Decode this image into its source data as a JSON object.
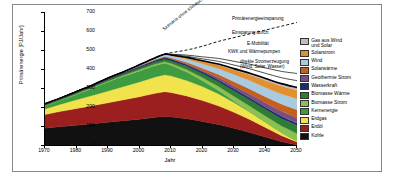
{
  "axes": {
    "ylabel": "Primärenergie [PJ/Jahr]",
    "xlabel": "Jahr",
    "yticks": [
      0,
      100,
      200,
      300,
      400,
      500,
      600,
      700
    ],
    "xticks": [
      1970,
      1980,
      1990,
      2000,
      2010,
      2020,
      2030,
      2040,
      2050
    ]
  },
  "annotations": {
    "saving": "Primärenergieeinsparung",
    "through": "Einsparung durch:",
    "emobility": "E-Mobilität",
    "chp": "KWK und Wärmepumpen",
    "direct": "direkte Stromerzeugung\n(Wind, Solar, Wasser)",
    "bau": "Szenario ohne Klimaschutz"
  },
  "legend": [
    {
      "label": "Gas aus Wind\nund Solar",
      "color": "#c9b6c4"
    },
    {
      "label": "Solarstrom",
      "color": "#e09030"
    },
    {
      "label": "Wind",
      "color": "#a8cbe2"
    },
    {
      "label": "Solarwärme",
      "color": "#c4601e"
    },
    {
      "label": "Geothermie Strom",
      "color": "#7b4f86"
    },
    {
      "label": "Wasserkraft",
      "color": "#1b2d6b"
    },
    {
      "label": "Biomasse Wärme",
      "color": "#2f7d32"
    },
    {
      "label": "Biomasse Strom",
      "color": "#8cc152"
    },
    {
      "label": "Kernenergie",
      "color": "#3f9b3f"
    },
    {
      "label": "Erdgas",
      "color": "#f2e34c"
    },
    {
      "label": "Erdöl",
      "color": "#9c1f1f"
    },
    {
      "label": "Kohle",
      "color": "#111111"
    }
  ],
  "chart_data": {
    "type": "area",
    "title": "",
    "xlabel": "Jahr",
    "ylabel": "Primärenergie [PJ/Jahr]",
    "xlim": [
      1970,
      2050
    ],
    "ylim": [
      0,
      700
    ],
    "grid": false,
    "legend_position": "right",
    "x": [
      1970,
      1975,
      1980,
      1985,
      1990,
      1995,
      2000,
      2005,
      2008,
      2010,
      2015,
      2020,
      2025,
      2030,
      2035,
      2040,
      2045,
      2050
    ],
    "series": [
      {
        "name": "Kohle",
        "color": "#111111",
        "values": [
          88,
          97,
          104,
          112,
          120,
          128,
          136,
          146,
          150,
          148,
          138,
          124,
          108,
          88,
          66,
          42,
          18,
          0
        ]
      },
      {
        "name": "Erdöl",
        "color": "#9c1f1f",
        "values": [
          72,
          80,
          88,
          95,
          102,
          110,
          118,
          126,
          130,
          128,
          120,
          110,
          98,
          84,
          68,
          50,
          32,
          16
        ]
      },
      {
        "name": "Erdgas",
        "color": "#f2e34c",
        "values": [
          30,
          38,
          46,
          54,
          62,
          70,
          78,
          86,
          90,
          88,
          82,
          74,
          64,
          52,
          40,
          28,
          16,
          6
        ]
      },
      {
        "name": "Kernenergie",
        "color": "#3f9b3f",
        "values": [
          14,
          20,
          28,
          38,
          48,
          54,
          58,
          60,
          60,
          56,
          44,
          30,
          18,
          8,
          2,
          0,
          0,
          0
        ]
      },
      {
        "name": "Biomasse Strom",
        "color": "#8cc152",
        "values": [
          2,
          2,
          3,
          3,
          4,
          5,
          6,
          8,
          9,
          10,
          13,
          17,
          21,
          25,
          29,
          32,
          35,
          38
        ]
      },
      {
        "name": "Biomasse Wärme",
        "color": "#2f7d32",
        "values": [
          6,
          6,
          7,
          7,
          8,
          9,
          10,
          12,
          13,
          14,
          17,
          21,
          25,
          29,
          33,
          36,
          39,
          42
        ]
      },
      {
        "name": "Wasserkraft",
        "color": "#1b2d6b",
        "values": [
          5,
          5,
          6,
          6,
          7,
          7,
          8,
          8,
          8,
          8,
          9,
          9,
          10,
          10,
          11,
          11,
          12,
          12
        ]
      },
      {
        "name": "Geothermie Strom",
        "color": "#7b4f86",
        "values": [
          0,
          0,
          0,
          0,
          0,
          0,
          1,
          1,
          2,
          2,
          4,
          7,
          11,
          15,
          19,
          23,
          27,
          30
        ]
      },
      {
        "name": "Solarwärme",
        "color": "#c4601e",
        "values": [
          0,
          0,
          0,
          0,
          1,
          1,
          2,
          3,
          4,
          5,
          8,
          12,
          17,
          22,
          27,
          32,
          37,
          42
        ]
      },
      {
        "name": "Wind",
        "color": "#a8cbe2",
        "values": [
          0,
          0,
          0,
          0,
          1,
          2,
          4,
          7,
          9,
          11,
          17,
          24,
          31,
          38,
          44,
          49,
          53,
          57
        ]
      },
      {
        "name": "Solarstrom",
        "color": "#e09030",
        "values": [
          0,
          0,
          0,
          0,
          0,
          0,
          1,
          2,
          3,
          4,
          8,
          13,
          19,
          25,
          31,
          37,
          42,
          46
        ]
      },
      {
        "name": "Gas aus Wind und Solar",
        "color": "#c9b6c4",
        "values": [
          0,
          0,
          0,
          0,
          0,
          0,
          0,
          0,
          0,
          0,
          1,
          2,
          4,
          6,
          8,
          10,
          12,
          14
        ]
      }
    ],
    "bau_line": {
      "name": "Szenario ohne Klimaschutz",
      "style": "dashed",
      "color": "#000000",
      "x": [
        2008,
        2015,
        2020,
        2025,
        2030,
        2035,
        2040,
        2045,
        2050
      ],
      "values": [
        480,
        500,
        520,
        545,
        565,
        585,
        605,
        625,
        645
      ]
    }
  }
}
